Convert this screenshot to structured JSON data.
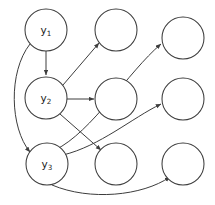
{
  "diagram": {
    "type": "directed-graph",
    "width": 215,
    "height": 205,
    "background_color": "#ffffff",
    "stroke_color": "#3d3d3d",
    "label_color": "#1a1a1a",
    "node_radius": 21,
    "nodes": [
      {
        "id": "y1",
        "label_base": "y",
        "label_sub": "1",
        "cx": 46,
        "cy": 30,
        "labeled": true
      },
      {
        "id": "r1c2",
        "label_base": "",
        "label_sub": "",
        "cx": 116,
        "cy": 30,
        "labeled": false
      },
      {
        "id": "r1c3",
        "label_base": "",
        "label_sub": "",
        "cx": 183,
        "cy": 38,
        "labeled": false
      },
      {
        "id": "y2",
        "label_base": "y",
        "label_sub": "2",
        "cx": 46,
        "cy": 98,
        "labeled": true
      },
      {
        "id": "r2c2",
        "label_base": "",
        "label_sub": "",
        "cx": 116,
        "cy": 99,
        "labeled": false
      },
      {
        "id": "r2c3",
        "label_base": "",
        "label_sub": "",
        "cx": 183,
        "cy": 99,
        "labeled": false
      },
      {
        "id": "y3",
        "label_base": "y",
        "label_sub": "3",
        "cx": 47,
        "cy": 164,
        "labeled": true
      },
      {
        "id": "r3c2",
        "label_base": "",
        "label_sub": "",
        "cx": 116,
        "cy": 164,
        "labeled": false
      },
      {
        "id": "r3c3",
        "label_base": "",
        "label_sub": "",
        "cx": 183,
        "cy": 164,
        "labeled": false
      }
    ],
    "edges": [
      {
        "id": "e-y1-y2",
        "from": "y1",
        "to": "y2",
        "shape": "straight",
        "d": "M 46 51 L 46 75",
        "arrow": true
      },
      {
        "id": "e-y1-y3",
        "from": "y1",
        "to": "y3",
        "shape": "curved",
        "d": "M 30 44 C 8 72, 10 128, 30 152",
        "arrow": true
      },
      {
        "id": "e-y2-r1c2",
        "from": "y2",
        "to": "r1c2",
        "shape": "straight",
        "d": "M 63 85 L 99 43",
        "arrow": true
      },
      {
        "id": "e-y2-r2c2",
        "from": "y2",
        "to": "r2c2",
        "shape": "straight",
        "d": "M 67 99 L 94 99",
        "arrow": true
      },
      {
        "id": "e-y2-r3c2",
        "from": "y2",
        "to": "r3c2",
        "shape": "straight",
        "d": "M 60 114 L 101 150",
        "arrow": true
      },
      {
        "id": "e-y3-r1c3",
        "from": "y3",
        "to": "r1c3",
        "shape": "curved",
        "d": "M 55 150 C 92 132, 128 72, 161 44",
        "arrow": true
      },
      {
        "id": "e-y3-r2c3",
        "from": "y3",
        "to": "r2c3",
        "shape": "curved",
        "d": "M 63 155 C 100 146, 132 118, 161 104",
        "arrow": true
      },
      {
        "id": "e-y3-r3c3",
        "from": "y3",
        "to": "r3c3",
        "shape": "curved",
        "d": "M 52 185 C 90 201, 142 196, 170 177",
        "arrow": true
      }
    ]
  }
}
